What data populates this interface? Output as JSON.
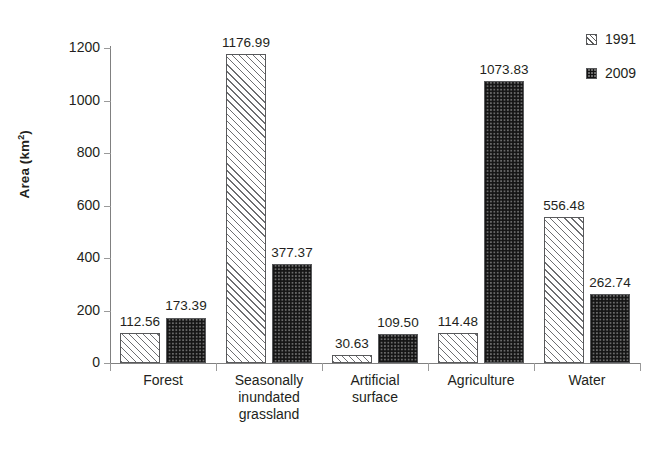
{
  "chart_data": {
    "type": "bar",
    "title": "",
    "xlabel": "",
    "ylabel": "Area (km2)",
    "ylabel_base": "Area (km",
    "ylabel_sup": "2",
    "ylabel_close": ")",
    "ylim": [
      0,
      1200
    ],
    "yticks": [
      0,
      200,
      400,
      600,
      800,
      1000,
      1200
    ],
    "ytick_labels": [
      "0",
      "200",
      "400",
      "600",
      "800",
      "1000",
      "1200"
    ],
    "grid": false,
    "legend_position": "top-right",
    "categories": [
      "Forest",
      "Seasonally inundated grassland",
      "Artificial surface",
      "Agriculture",
      "Water"
    ],
    "category_lines": [
      [
        "Forest"
      ],
      [
        "Seasonally",
        "inundated",
        "grassland"
      ],
      [
        "Artificial",
        "surface"
      ],
      [
        "Agriculture"
      ],
      [
        "Water"
      ]
    ],
    "series": [
      {
        "name": "1991",
        "pattern": "diagonal-hatch",
        "color": "#ffffff",
        "edge_color": "#58595b",
        "values": [
          112.56,
          1176.99,
          30.63,
          114.48,
          556.48
        ],
        "labels": [
          "112.56",
          "1176.99",
          "30.63",
          "114.48",
          "556.48"
        ]
      },
      {
        "name": "2009",
        "pattern": "dotted-grid",
        "color": "#6a6a6a",
        "edge_color": "#58595b",
        "values": [
          173.39,
          377.37,
          109.5,
          1073.83,
          262.74
        ],
        "labels": [
          "173.39",
          "377.37",
          "109.50",
          "1073.83",
          "262.74"
        ]
      }
    ]
  },
  "legend": {
    "entries": [
      {
        "label": "1991",
        "swatch": "diagonal-hatch-swatch"
      },
      {
        "label": "2009",
        "swatch": "dotted-grid-swatch"
      }
    ]
  }
}
